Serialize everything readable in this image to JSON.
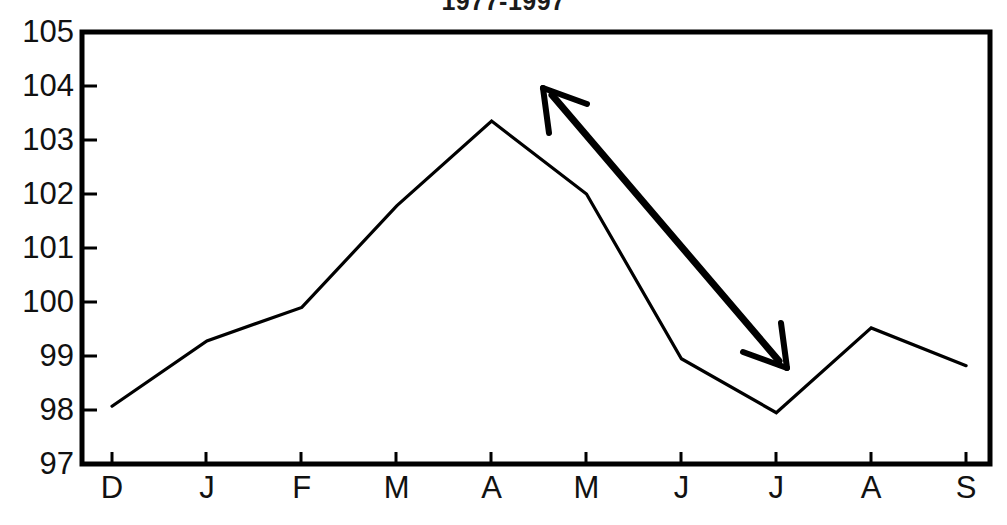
{
  "chart_data": {
    "type": "line",
    "title": "1977-1997",
    "title_note": "clipped at top edge of screenshot",
    "xlabel": "",
    "ylabel": "",
    "categories": [
      "D",
      "J",
      "F",
      "M",
      "A",
      "M",
      "J",
      "J",
      "A",
      "S"
    ],
    "values": [
      98.07,
      99.28,
      99.9,
      101.78,
      103.35,
      102.0,
      98.95,
      97.95,
      99.52,
      98.82
    ],
    "series": [
      {
        "name": "index",
        "values": [
          98.07,
          99.28,
          99.9,
          101.78,
          103.35,
          102.0,
          98.95,
          97.95,
          99.52,
          98.82
        ]
      }
    ],
    "ylim": [
      97,
      105
    ],
    "yticks": [
      97,
      98,
      99,
      100,
      101,
      102,
      103,
      104,
      105
    ],
    "ytick_labels": [
      "97",
      "98",
      "99",
      "100",
      "101",
      "102",
      "103",
      "104",
      "105"
    ],
    "xtick_labels": [
      "D",
      "J",
      "F",
      "M",
      "A",
      "M",
      "J",
      "J",
      "A",
      "S"
    ],
    "grid": false,
    "legend": null,
    "line_color": "#000000",
    "frame_color": "#000000",
    "background_color": "#ffffff",
    "annotations": [
      {
        "name": "trend-arrow",
        "type": "double-headed-arrow",
        "from": {
          "x_label": "A",
          "y_value": 104.05
        },
        "to": {
          "x_label": "J",
          "y_value": 98.82
        },
        "color": "#000000"
      }
    ]
  },
  "axes": {
    "y_labels": [
      "105",
      "104",
      "103",
      "102",
      "101",
      "100",
      "99",
      "98",
      "97"
    ],
    "x_labels": [
      "D",
      "J",
      "F",
      "M",
      "A",
      "M",
      "J",
      "J",
      "A",
      "S"
    ]
  }
}
